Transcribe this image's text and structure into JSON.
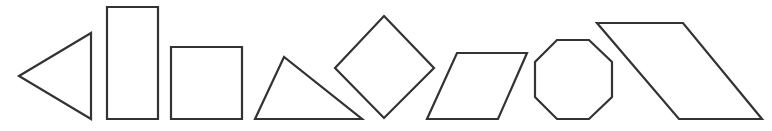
{
  "figure": {
    "width": 772,
    "height": 131,
    "background": "#ffffff",
    "stroke_color": "#333333",
    "fill_color": "#ffffff",
    "stroke_width": 2.2,
    "shapes": [
      {
        "id": "triangle-left-pointing",
        "kind": "triangle",
        "points": "19,76 91,33 91,119"
      },
      {
        "id": "tall-rectangle",
        "kind": "rectangle",
        "points": "107,7 158,7 158,119 107,119"
      },
      {
        "id": "square",
        "kind": "square",
        "points": "171,47 242,47 242,119 171,119"
      },
      {
        "id": "scalene-triangle",
        "kind": "triangle",
        "points": "255,119 284,57 362,119"
      },
      {
        "id": "rotated-square-diamond",
        "kind": "diamond",
        "points": "384,16 434,68 384,118 335,68"
      },
      {
        "id": "parallelogram-right-leaning",
        "kind": "parallelogram",
        "points": "457,53 527,53 498,119 427,119"
      },
      {
        "id": "octagon",
        "kind": "octagon",
        "points": "557,40 589,40 612,62 612,97 589,119 557,119 535,97 535,62"
      },
      {
        "id": "parallelogram-left-leaning",
        "kind": "parallelogram",
        "points": "597,23 683,23 762,119 679,119"
      }
    ]
  }
}
